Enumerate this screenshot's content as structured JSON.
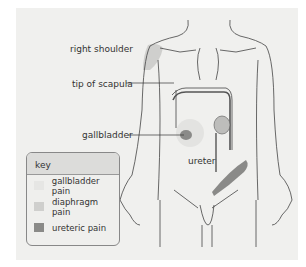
{
  "labels": {
    "right_shoulder": "right shoulder",
    "tip_of_scapula": "tip of scapula",
    "gallbladder": "gallbladder",
    "ureter": "ureter"
  },
  "key": {
    "title": "key",
    "items": [
      {
        "label": "gallbladder pain",
        "color": "#e6e6e4"
      },
      {
        "label": "diaphragm pain",
        "color": "#cfcfcd"
      },
      {
        "label": "ureteric pain",
        "color": "#8a8a88"
      }
    ]
  }
}
